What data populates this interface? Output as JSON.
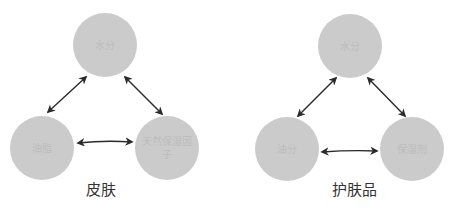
{
  "diagrams": [
    {
      "caption": "皮肤",
      "nodes": {
        "top": "水分",
        "bottom_left": "油脂",
        "bottom_right": "天然保湿因子"
      }
    },
    {
      "caption": "护肤品",
      "nodes": {
        "top": "水分",
        "bottom_left": "油分",
        "bottom_right": "保湿剂"
      }
    }
  ],
  "colors": {
    "node_fill": "#cbcbcb",
    "node_text": "#bcbcbc",
    "arrow": "#2a2a2a",
    "caption_text": "#333333"
  },
  "edges": [
    {
      "diagram": 0,
      "from": "top",
      "to": "bottom_left",
      "bidirectional": true
    },
    {
      "diagram": 0,
      "from": "top",
      "to": "bottom_right",
      "bidirectional": true
    },
    {
      "diagram": 0,
      "from": "bottom_left",
      "to": "bottom_right",
      "bidirectional": true
    },
    {
      "diagram": 1,
      "from": "top",
      "to": "bottom_left",
      "bidirectional": true
    },
    {
      "diagram": 1,
      "from": "top",
      "to": "bottom_right",
      "bidirectional": true
    },
    {
      "diagram": 1,
      "from": "bottom_left",
      "to": "bottom_right",
      "bidirectional": true
    }
  ]
}
